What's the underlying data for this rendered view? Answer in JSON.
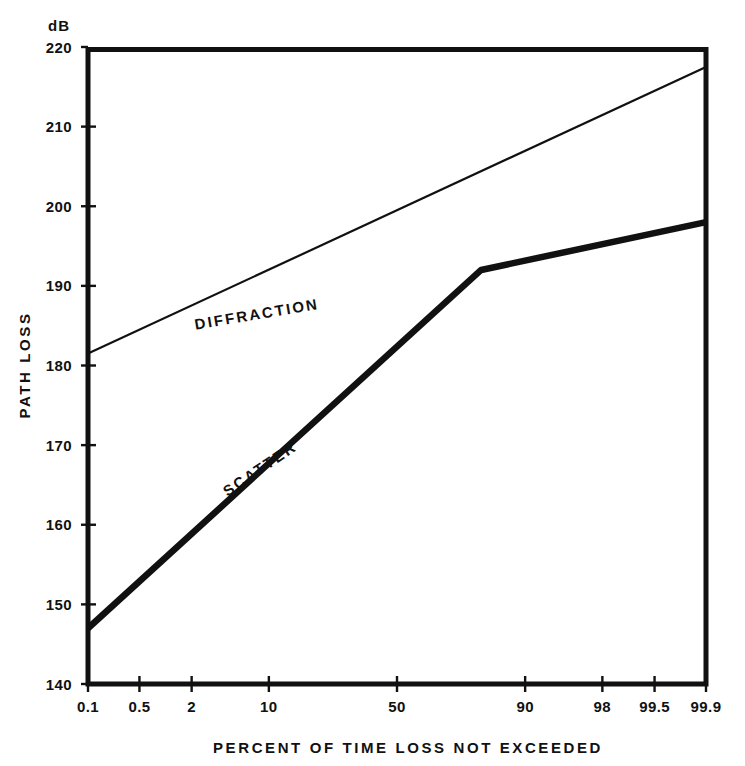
{
  "chart_data": {
    "type": "line",
    "title": "",
    "xlabel": "PERCENT OF TIME LOSS NOT EXCEEDED",
    "ylabel": "PATH LOSS",
    "yunit": "dB",
    "x_scale": "normal-probability",
    "xlim": [
      0.1,
      99.9
    ],
    "ylim": [
      140,
      220
    ],
    "ytick_labels": [
      "140",
      "150",
      "160",
      "170",
      "180",
      "190",
      "200",
      "210",
      "220"
    ],
    "ytick_values": [
      140,
      150,
      160,
      170,
      180,
      190,
      200,
      210,
      220
    ],
    "xtick_labels": [
      "0.1",
      "0.5",
      "2",
      "10",
      "50",
      "90",
      "98",
      "99.5",
      "99.9"
    ],
    "xtick_values": [
      0.1,
      0.5,
      2,
      10,
      50,
      90,
      98,
      99.5,
      99.9
    ],
    "grid": false,
    "legend": "inline-annotations",
    "series": [
      {
        "name": "DIFFRACTION",
        "style": "thin",
        "x": [
          0.1,
          99.9
        ],
        "values": [
          181.5,
          217.5
        ]
      },
      {
        "name": "SCATTER",
        "style": "thick",
        "x": [
          0.1,
          80,
          99.9
        ],
        "values": [
          147.0,
          192.0,
          198.0
        ]
      }
    ],
    "annotations": [
      {
        "text": "DIFFRACTION",
        "x_pct": 2.2,
        "y": 184.5,
        "rotation": -9.5
      },
      {
        "text": "SCATTER",
        "x_pct": 4.5,
        "y": 163.5,
        "rotation": -34.0
      }
    ],
    "crossing_point": {
      "x_pct": 80,
      "y": 192
    }
  },
  "axes": {
    "y_unit_label": "dB",
    "y_axis_title": "PATH LOSS",
    "x_axis_title": "PERCENT OF TIME LOSS NOT EXCEEDED"
  },
  "colors": {
    "ink": "#111111",
    "background": "#ffffff"
  }
}
